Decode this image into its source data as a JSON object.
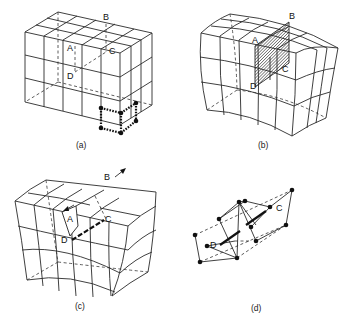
{
  "figure": {
    "panels": [
      {
        "id": "a",
        "caption": "(a)",
        "labels": {
          "A": "A",
          "B": "B",
          "C": "C",
          "D": "D"
        },
        "description": "Perfect cubic crystal lattice block, 5x4x3 cells, with dashed plane ABCD and a dotted Burgers-circuit cell at bottom-right corner"
      },
      {
        "id": "b",
        "caption": "(b)",
        "labels": {
          "A": "A",
          "B": "B",
          "C": "C",
          "D": "D"
        },
        "description": "Distorted lattice with shaded slip plane ABCD"
      },
      {
        "id": "c",
        "caption": "(c)",
        "labels": {
          "A": "A",
          "B": "B",
          "C": "C",
          "D": "D"
        },
        "description": "Lattice with step along AB, arrows showing slip direction, dislocation line DC"
      },
      {
        "id": "d",
        "caption": "(d)",
        "labels": {
          "C": "C",
          "D": "D"
        },
        "description": "Atom positions around dislocation line DC"
      }
    ]
  }
}
